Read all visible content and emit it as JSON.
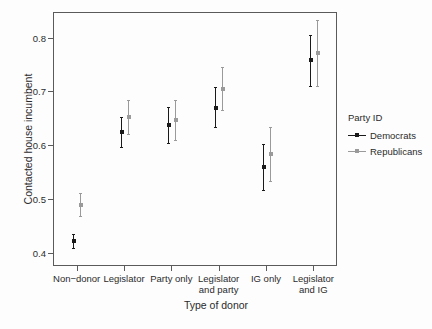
{
  "chart_data": {
    "type": "scatter",
    "title": "",
    "subtitle": "",
    "xlabel": "Type of donor",
    "ylabel": "Contacted house incumbent",
    "categories": [
      "Non−donor",
      "Legislator",
      "Party only",
      "Legislator and party",
      "IG only",
      "Legislator and IG"
    ],
    "category_lines": [
      [
        "Non−donor"
      ],
      [
        "Legislator"
      ],
      [
        "Party only"
      ],
      [
        "Legislator",
        "and party"
      ],
      [
        "IG only"
      ],
      [
        "Legislator",
        "and IG"
      ]
    ],
    "yticks": [
      0.4,
      0.5,
      0.6,
      0.7,
      0.8
    ],
    "ytick_labels": [
      "0.4",
      "0.5",
      "0.6",
      "0.7",
      "0.8"
    ],
    "ylim": [
      0.375,
      0.848
    ],
    "grid": false,
    "legend_position": "right",
    "legend_title": "Party ID",
    "error_bar_type": "confidence interval",
    "series": [
      {
        "name": "Democrats",
        "color": "#1a1a1a",
        "values": [
          0.422,
          0.624,
          0.637,
          0.67,
          0.559,
          0.759
        ],
        "ci_lower": [
          0.408,
          0.597,
          0.604,
          0.633,
          0.516,
          0.71
        ],
        "ci_upper": [
          0.434,
          0.652,
          0.671,
          0.708,
          0.602,
          0.806
        ]
      },
      {
        "name": "Republicans",
        "color": "#9a9a9a",
        "values": [
          0.489,
          0.653,
          0.647,
          0.705,
          0.584,
          0.772
        ],
        "ci_lower": [
          0.468,
          0.621,
          0.61,
          0.665,
          0.533,
          0.71
        ],
        "ci_upper": [
          0.511,
          0.685,
          0.684,
          0.745,
          0.634,
          0.834
        ]
      }
    ]
  },
  "legend": {
    "title": "Party ID",
    "entries": [
      {
        "label": "Democrats",
        "color": "#1a1a1a"
      },
      {
        "label": "Republicans",
        "color": "#9a9a9a"
      }
    ]
  },
  "axes": {
    "x_title": "Type of donor",
    "y_title": "Contacted house incumbent"
  },
  "colors": {
    "democrats": "#1a1a1a",
    "republicans": "#9a9a9a",
    "axis": "#5a5a5a",
    "background": "#fdfdfd",
    "text": "#2b2b2b"
  }
}
